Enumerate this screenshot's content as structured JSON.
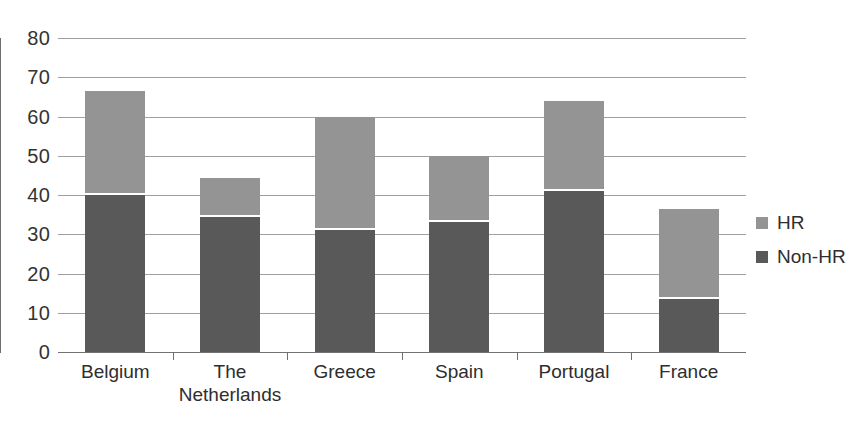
{
  "chart_data": {
    "type": "bar",
    "subtype": "stacked-bar",
    "title": "",
    "subtitle": "",
    "xlabel": "",
    "ylabel": "",
    "categories": [
      "Belgium",
      "The\nNetherlands",
      "Greece",
      "Spain",
      "Portugal",
      "France"
    ],
    "series": [
      {
        "name": "Non-HR",
        "values": [
          40,
          34.3,
          31.2,
          33.2,
          41,
          13.5
        ],
        "color": "#595959"
      },
      {
        "name": "HR",
        "values": [
          26.6,
          10,
          28.8,
          16.8,
          23,
          23
        ],
        "color": "#949494"
      }
    ],
    "totals": [
      66.6,
      44.3,
      60,
      50,
      64,
      36.5
    ],
    "ylim": [
      0,
      80
    ],
    "yticks": [
      0,
      10,
      20,
      30,
      40,
      50,
      60,
      70,
      80
    ],
    "ytick_labels": [
      "0",
      "10",
      "20",
      "30",
      "40",
      "50",
      "60",
      "70",
      "80"
    ],
    "grid": true,
    "grid_axis": "y",
    "legend": {
      "position": "right",
      "entries": [
        {
          "label": "HR",
          "color": "#949494"
        },
        {
          "label": "Non-HR",
          "color": "#595959"
        }
      ]
    },
    "colors": {
      "hr": "#949494",
      "non_hr": "#595959",
      "gridline": "#8e8e8e",
      "axis": "#6e6e6e",
      "text": "#2e2e2e",
      "background": "#ffffff"
    }
  }
}
